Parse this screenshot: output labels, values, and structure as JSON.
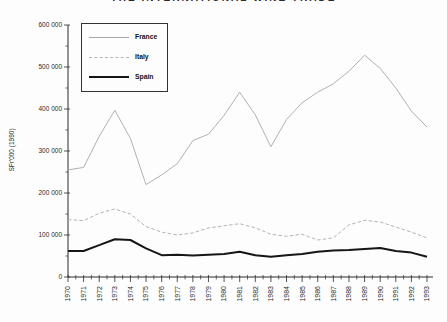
{
  "chart_data": {
    "type": "line",
    "title": "THE INTERNATIONAL WINE TRADE",
    "title_clipped_at_top": true,
    "xlabel": "",
    "ylabel": "SFr'000 (1990)",
    "x": [
      1970,
      1971,
      1972,
      1973,
      1974,
      1975,
      1976,
      1977,
      1978,
      1979,
      1980,
      1981,
      1982,
      1983,
      1984,
      1985,
      1986,
      1987,
      1988,
      1989,
      1990,
      1991,
      1992,
      1993
    ],
    "xtick_labels": [
      "1970",
      "1971",
      "1972",
      "1973",
      "1974",
      "1975",
      "1976",
      "1977",
      "1978",
      "1979",
      "1980",
      "1981",
      "1982",
      "1983",
      "1984",
      "1985",
      "1986",
      "1987",
      "1988",
      "1989",
      "1990",
      "1991",
      "1992",
      "1993"
    ],
    "ylim": [
      0,
      600000
    ],
    "yticks": [
      0,
      100000,
      200000,
      300000,
      400000,
      500000,
      600000
    ],
    "ytick_labels": [
      "0",
      "100 000",
      "200 000",
      "300 000",
      "400 000",
      "500 000",
      "600 000"
    ],
    "minor_ytick_step": 50000,
    "grid": false,
    "legend_position": "upper-left",
    "axis_color": "#2b2b2b",
    "series": [
      {
        "name": "France",
        "color": "#a8a8a8",
        "stroke_width": 0.9,
        "dash": "",
        "values": [
          255000,
          261000,
          335000,
          397000,
          330000,
          220000,
          243000,
          270000,
          325000,
          340000,
          385000,
          440000,
          386000,
          310000,
          375000,
          415000,
          440000,
          460000,
          490000,
          528000,
          497000,
          450000,
          395000,
          357000
        ]
      },
      {
        "name": "Italy",
        "color": "#b4b4b4",
        "stroke_width": 1,
        "dash": "3.5 2.2",
        "values": [
          137000,
          134000,
          152000,
          162000,
          150000,
          120000,
          107000,
          100000,
          105000,
          117000,
          122000,
          127000,
          117000,
          102000,
          97000,
          102000,
          88000,
          93000,
          124000,
          135000,
          131000,
          119000,
          107000,
          93000
        ]
      },
      {
        "name": "Spain",
        "color": "#161616",
        "stroke_width": 2,
        "dash": "",
        "values": [
          62000,
          62000,
          76000,
          90000,
          88000,
          68000,
          52000,
          53000,
          51000,
          53000,
          55000,
          60000,
          52000,
          48000,
          52000,
          55000,
          60000,
          63000,
          64000,
          67000,
          69000,
          62000,
          58000,
          48000
        ]
      }
    ]
  }
}
